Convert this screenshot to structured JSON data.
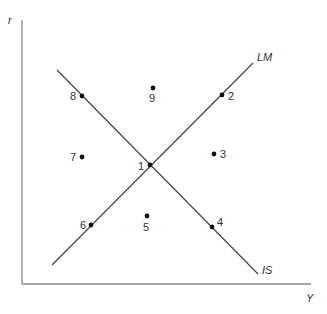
{
  "chart_data": {
    "type": "diagram",
    "xlabel": "Y",
    "ylabel": "r",
    "colors": {
      "axis": "#888888",
      "line": "#444444",
      "point": "#111111",
      "text": "#333333"
    },
    "axes": {
      "y": {
        "x1": 22,
        "y1": 20,
        "x2": 22,
        "y2": 284
      },
      "x": {
        "x1": 22,
        "y1": 284,
        "x2": 311,
        "y2": 284
      }
    },
    "curves": [
      {
        "name": "IS",
        "label": "IS",
        "x1": 57,
        "y1": 70,
        "x2": 258,
        "y2": 274,
        "label_x": 262,
        "label_y": 274
      },
      {
        "name": "LM",
        "label": "LM",
        "x1": 52,
        "y1": 265,
        "x2": 253,
        "y2": 63,
        "label_x": 257,
        "label_y": 61
      }
    ],
    "points": [
      {
        "label": "1",
        "x": 150,
        "y": 165,
        "tx": 138,
        "ty": 170
      },
      {
        "label": "2",
        "x": 222,
        "y": 95,
        "tx": 228,
        "ty": 100
      },
      {
        "label": "3",
        "x": 214,
        "y": 154,
        "tx": 220,
        "ty": 158
      },
      {
        "label": "4",
        "x": 212,
        "y": 227,
        "tx": 217,
        "ty": 226
      },
      {
        "label": "5",
        "x": 147,
        "y": 216,
        "tx": 143,
        "ty": 231
      },
      {
        "label": "6",
        "x": 91,
        "y": 225,
        "tx": 80,
        "ty": 229
      },
      {
        "label": "7",
        "x": 82,
        "y": 157,
        "tx": 70,
        "ty": 161
      },
      {
        "label": "8",
        "x": 82,
        "y": 96,
        "tx": 70,
        "ty": 100
      },
      {
        "label": "9",
        "x": 153,
        "y": 88,
        "tx": 149,
        "ty": 102
      }
    ]
  },
  "axis_labels": {
    "y": "r",
    "x": "Y"
  }
}
